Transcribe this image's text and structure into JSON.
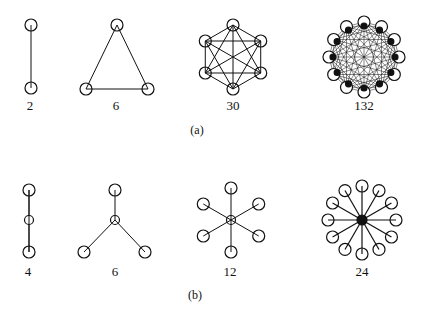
{
  "panels": [
    {
      "caption": "(a)",
      "graphs": [
        {
          "label": "2",
          "type": "complete",
          "nodes": 2
        },
        {
          "label": "6",
          "type": "complete",
          "nodes": 3
        },
        {
          "label": "30",
          "type": "complete",
          "nodes": 6
        },
        {
          "label": "132",
          "type": "complete",
          "nodes": 12
        }
      ]
    },
    {
      "caption": "(b)",
      "graphs": [
        {
          "label": "4",
          "type": "star",
          "leaves": 2
        },
        {
          "label": "6",
          "type": "star",
          "leaves": 3
        },
        {
          "label": "12",
          "type": "star",
          "leaves": 6
        },
        {
          "label": "24",
          "type": "star",
          "leaves": 12
        }
      ]
    }
  ],
  "colors": {
    "stroke": "#111111",
    "background": "#ffffff"
  }
}
